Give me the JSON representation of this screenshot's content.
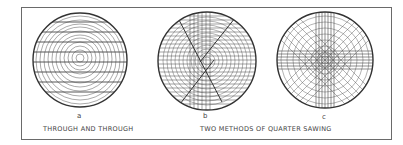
{
  "figure": {
    "panels": [
      {
        "letter": "a",
        "method": "through-and-through"
      },
      {
        "letter": "b",
        "method": "quarter-sawing-1"
      },
      {
        "letter": "c",
        "method": "quarter-sawing-2"
      }
    ],
    "captions": {
      "left": "THROUGH AND THROUGH",
      "right": "TWO  METHODS  OF  QUARTER  SAWING"
    }
  }
}
